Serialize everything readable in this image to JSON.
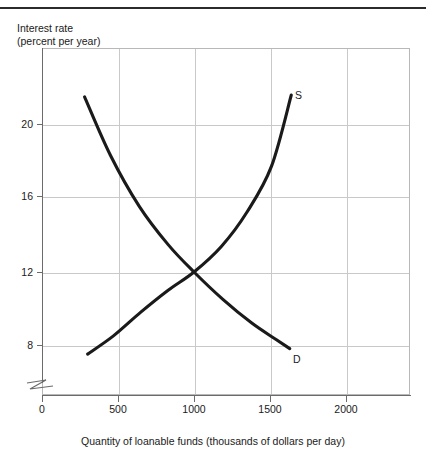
{
  "chart_data": {
    "type": "line",
    "title": "",
    "ylabel": "Interest rate (percent per year)",
    "ylabel_line1": "Interest rate",
    "ylabel_line2": "(percent per year)",
    "xlabel": "Quantity of loanable funds (thousands of dollars per day)",
    "xlim": [
      0,
      2420
    ],
    "ylim": [
      5.0,
      24.3
    ],
    "xticks": [
      0,
      500,
      1000,
      1500,
      2000
    ],
    "xtick_labels": [
      "0",
      "500",
      "1000",
      "1500",
      "2000"
    ],
    "yticks": [
      8,
      12,
      16,
      20
    ],
    "ytick_labels": [
      "8",
      "12",
      "16",
      "20"
    ],
    "grid": true,
    "legend_position": "inline-end-labels",
    "axis_break": "y-axis below 8",
    "equilibrium": {
      "quantity": 1000,
      "interest_rate": 12
    },
    "series": [
      {
        "name": "D",
        "label": "D",
        "description": "Demand for loanable funds, downward sloping convex curve",
        "points": [
          {
            "x": 280,
            "y": 21.6
          },
          {
            "x": 450,
            "y": 18.4
          },
          {
            "x": 640,
            "y": 15.6
          },
          {
            "x": 830,
            "y": 13.5
          },
          {
            "x": 1000,
            "y": 12.0
          },
          {
            "x": 1190,
            "y": 10.5
          },
          {
            "x": 1380,
            "y": 9.2
          },
          {
            "x": 1540,
            "y": 8.3
          },
          {
            "x": 1630,
            "y": 7.8
          }
        ]
      },
      {
        "name": "S",
        "label": "S",
        "description": "Supply of loanable funds, upward sloping convex curve",
        "points": [
          {
            "x": 300,
            "y": 7.5
          },
          {
            "x": 470,
            "y": 8.5
          },
          {
            "x": 650,
            "y": 9.8
          },
          {
            "x": 830,
            "y": 11.0
          },
          {
            "x": 1000,
            "y": 12.0
          },
          {
            "x": 1180,
            "y": 13.4
          },
          {
            "x": 1350,
            "y": 15.3
          },
          {
            "x": 1510,
            "y": 17.8
          },
          {
            "x": 1640,
            "y": 21.7
          }
        ]
      }
    ]
  },
  "colors": {
    "curve": "#1a1a1a",
    "grid": "#c9c9c9",
    "axis": "#6b6b6b",
    "frame": "#b8b8b8",
    "top_rule": "#2b2b2b",
    "text": "#1a1a1a"
  }
}
